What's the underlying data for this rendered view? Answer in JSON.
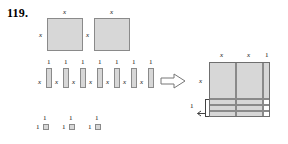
{
  "problem": {
    "number": "119."
  },
  "labels": {
    "x": "x",
    "one": "1"
  },
  "left_group": {
    "name": "x-squared-tiles",
    "count": 2,
    "top_labels": [
      "x",
      "x"
    ],
    "side_labels": [
      "x",
      "x"
    ]
  },
  "middle_group": {
    "name": "x-tiles",
    "count": 7,
    "top_labels": [
      "1",
      "1",
      "1",
      "1",
      "1",
      "1",
      "1"
    ],
    "side_labels": [
      "x",
      "x",
      "x",
      "x",
      "x",
      "x",
      "x"
    ]
  },
  "bottom_group": {
    "name": "unit-tiles",
    "count": 3,
    "top_labels": [
      "1",
      "1",
      "1"
    ],
    "side_labels": [
      "1",
      "1",
      "1"
    ]
  },
  "arrow": {
    "name": "right-arrow",
    "glyph": "⇨"
  },
  "assembled": {
    "column_labels": [
      "x",
      "x",
      "1"
    ],
    "row_label_left": "x",
    "bracket_label": "1",
    "columns": 3,
    "rows": 4
  },
  "colors": {
    "tile_fill": "#d7d7d7",
    "tile_stroke": "#8a8a8a",
    "grid_stroke": "#6f6f6f",
    "text": "#111111"
  }
}
